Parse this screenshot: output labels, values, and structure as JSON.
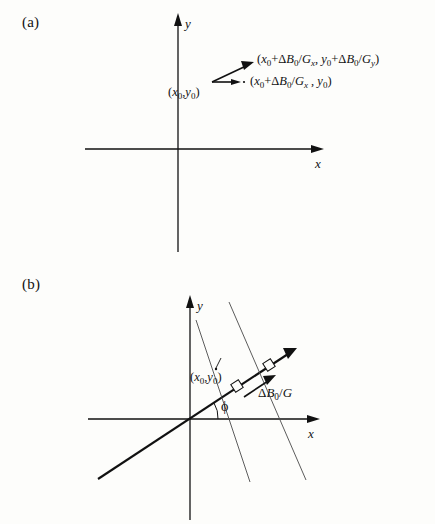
{
  "figure": {
    "background_color": "#fdfdfb",
    "ink_color": "#111111",
    "iso_line_color": "#4a4a4a"
  },
  "panel_a": {
    "label": "(a)",
    "axes": {
      "x_label": "x",
      "y_label": "y"
    },
    "point_label": "(x0,y0)",
    "point_label_parts": {
      "open": "(",
      "x": "x",
      "x_sub": "0",
      "comma": ",",
      "y": "y",
      "y_sub": "0",
      "close": ")"
    },
    "vectors": [
      {
        "name": "diagonal-shift-vector",
        "label": "(x0+ΔB0/Gx, y0+ΔB0/Gy)",
        "direction": "up-right"
      },
      {
        "name": "horizontal-shift-vector",
        "label": "(x0+ΔB0/Gx , y0)",
        "direction": "right"
      }
    ]
  },
  "panel_b": {
    "label": "(b)",
    "axes": {
      "x_label": "x",
      "y_label": "y"
    },
    "point_label": "(x0,y0)",
    "angle_label": "ϕ",
    "offset_label": "ΔB0/G",
    "offset_label_parts": {
      "delta": "Δ",
      "B": "B",
      "B_sub": "0",
      "slash": "/",
      "G": "G"
    },
    "iso_lines": [
      {
        "name": "iso-line-through-point"
      },
      {
        "name": "iso-line-shifted"
      }
    ],
    "right_angle_markers": 2
  }
}
